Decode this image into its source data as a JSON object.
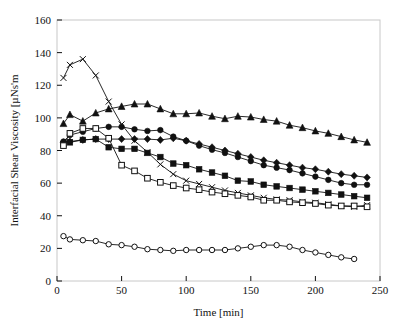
{
  "figure": {
    "title": "",
    "background_color": "#ffffff",
    "frame_color": "#c8c8c8",
    "series_color": "#111111"
  },
  "axes": {
    "x_title": "Time [min]",
    "y_title": "Interfacial Shear Viscosity [µNs'm",
    "x_ticks": [
      "0",
      "50",
      "100",
      "150",
      "200",
      "250"
    ],
    "y_ticks": [
      "0",
      "20",
      "40",
      "60",
      "80",
      "100",
      "120",
      "140",
      "160"
    ]
  },
  "chart_data": {
    "type": "line",
    "title": "",
    "xlabel": "Time [min]",
    "ylabel": "Interfacial Shear Viscosity [µNs'm",
    "xlim": [
      0,
      250
    ],
    "ylim": [
      0,
      160
    ],
    "xticks": [
      0,
      50,
      100,
      150,
      200,
      250
    ],
    "yticks": [
      0,
      20,
      40,
      60,
      80,
      100,
      120,
      140,
      160
    ],
    "grid": false,
    "legend": "none",
    "series": [
      {
        "name": "series-x-cross",
        "marker": "x",
        "x": [
          5,
          10,
          20,
          30,
          40,
          50,
          60,
          70,
          80,
          90,
          100,
          110,
          120,
          130,
          140,
          150,
          160,
          170,
          180,
          190,
          200,
          210,
          220,
          230,
          240
        ],
        "y": [
          124.5,
          132.5,
          136.0,
          126.0,
          110.0,
          96.0,
          86.0,
          79.0,
          71.5,
          65.5,
          61.5,
          59.5,
          57.5,
          55.5,
          54.0,
          52.5,
          51.0,
          50.0,
          49.5,
          48.5,
          48.0,
          47.0,
          46.0,
          45.5,
          46.5
        ]
      },
      {
        "name": "series-filled-triangle",
        "marker": "triangle",
        "x": [
          5,
          10,
          20,
          30,
          40,
          50,
          60,
          70,
          80,
          90,
          100,
          110,
          120,
          130,
          140,
          150,
          160,
          170,
          180,
          190,
          200,
          210,
          220,
          230,
          240
        ],
        "y": [
          96.5,
          102.0,
          98.0,
          103.0,
          105.5,
          107.0,
          108.5,
          108.5,
          105.5,
          102.5,
          102.5,
          103.0,
          101.0,
          99.5,
          101.0,
          100.5,
          99.0,
          98.0,
          95.5,
          94.0,
          92.0,
          90.5,
          88.5,
          86.5,
          85.0
        ]
      },
      {
        "name": "series-filled-circle",
        "marker": "circle-filled",
        "x": [
          5,
          10,
          20,
          30,
          40,
          50,
          60,
          70,
          80,
          90,
          100,
          110,
          120,
          130,
          140,
          150,
          160,
          170,
          180,
          190,
          200,
          210,
          220,
          230,
          240
        ],
        "y": [
          85.5,
          89.5,
          91.5,
          93.5,
          94.5,
          94.5,
          93.0,
          92.0,
          92.5,
          88.5,
          86.0,
          83.0,
          80.5,
          78.5,
          76.0,
          73.5,
          71.0,
          69.5,
          68.0,
          66.0,
          64.0,
          62.0,
          60.0,
          59.0,
          59.0
        ]
      },
      {
        "name": "series-diamond",
        "marker": "diamond",
        "x": [
          5,
          10,
          20,
          30,
          40,
          50,
          60,
          70,
          80,
          90,
          100,
          110,
          120,
          130,
          140,
          150,
          160,
          170,
          180,
          190,
          200,
          210,
          220,
          230,
          240
        ],
        "y": [
          85.0,
          85.5,
          86.5,
          87.0,
          87.0,
          87.0,
          87.0,
          87.0,
          86.5,
          87.5,
          86.0,
          84.0,
          82.0,
          80.0,
          78.0,
          76.0,
          74.0,
          72.5,
          71.0,
          69.5,
          68.5,
          67.0,
          65.5,
          64.5,
          63.5
        ]
      },
      {
        "name": "series-filled-square",
        "marker": "square-filled",
        "x": [
          5,
          10,
          20,
          30,
          40,
          50,
          60,
          70,
          80,
          90,
          100,
          110,
          120,
          130,
          140,
          150,
          160,
          170,
          180,
          190,
          200,
          210,
          220,
          230,
          240
        ],
        "y": [
          84.0,
          85.0,
          86.5,
          87.0,
          82.0,
          81.0,
          81.0,
          78.5,
          76.0,
          72.0,
          71.0,
          68.5,
          66.5,
          64.5,
          61.5,
          61.0,
          59.0,
          58.0,
          57.0,
          56.0,
          55.0,
          54.0,
          53.0,
          52.0,
          51.0
        ]
      },
      {
        "name": "series-open-square",
        "marker": "square-open",
        "x": [
          5,
          10,
          20,
          30,
          40,
          50,
          60,
          70,
          80,
          90,
          100,
          110,
          120,
          130,
          140,
          150,
          160,
          170,
          180,
          190,
          200,
          210,
          220,
          230,
          240
        ],
        "y": [
          83.0,
          90.5,
          93.5,
          93.5,
          87.5,
          71.0,
          67.5,
          63.0,
          60.5,
          58.5,
          57.0,
          56.0,
          54.5,
          53.5,
          52.5,
          51.5,
          49.5,
          49.5,
          48.5,
          48.0,
          47.5,
          46.5,
          46.0,
          46.0,
          45.5
        ]
      },
      {
        "name": "series-open-circle",
        "marker": "circle-open",
        "x": [
          5,
          10,
          20,
          30,
          40,
          50,
          60,
          70,
          80,
          90,
          100,
          110,
          120,
          130,
          140,
          150,
          160,
          170,
          180,
          190,
          200,
          210,
          220,
          230
        ],
        "y": [
          27.5,
          25.5,
          25.0,
          24.5,
          22.5,
          22.0,
          21.0,
          19.5,
          19.0,
          18.5,
          19.0,
          19.0,
          19.0,
          19.0,
          20.0,
          21.0,
          22.0,
          22.0,
          21.0,
          19.0,
          17.5,
          16.0,
          14.5,
          13.5
        ]
      }
    ]
  }
}
